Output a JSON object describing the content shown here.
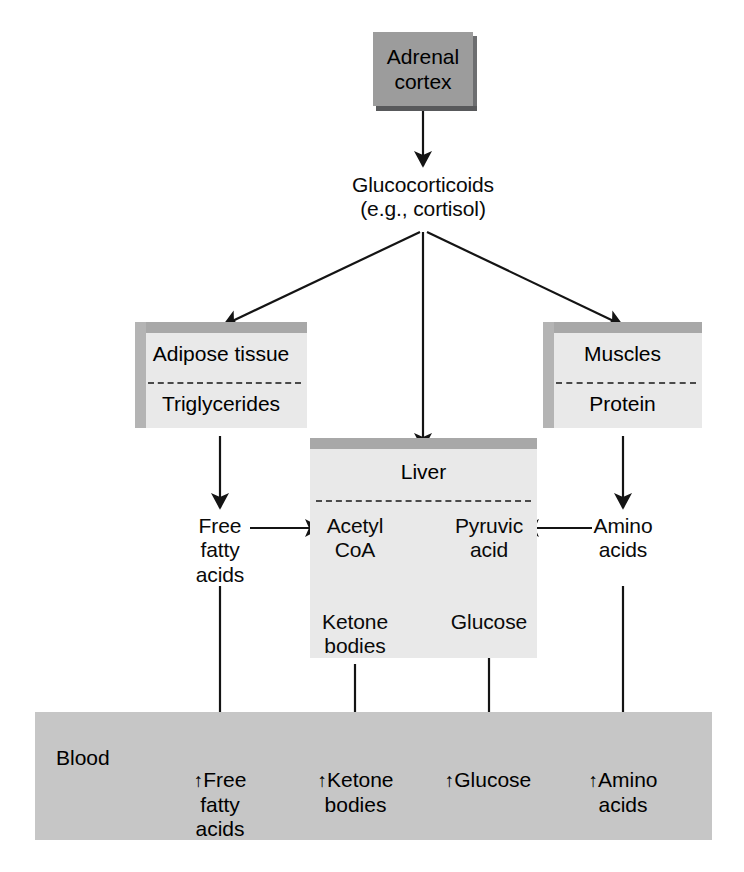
{
  "diagram": {
    "type": "flow-diagram",
    "background_color": "#ffffff",
    "palette": {
      "adrenal_box_fill": "#9c9c9c",
      "adrenal_box_shadow": "#58595b",
      "tissue_box_fill": "#e9e9e9",
      "tissue_box_bevel_top": "#a8a8a8",
      "tissue_box_bevel_side": "#b4b4b4",
      "blood_band_fill": "#c6c6c6",
      "arrow_color": "#141414",
      "text_color": "#0a0a0a"
    }
  },
  "source": {
    "label": "Adrenal\ncortex"
  },
  "hormone": {
    "label": "Glucocorticoids\n(e.g., cortisol)"
  },
  "tissues": {
    "adipose": {
      "title": "Adipose tissue",
      "substrate": "Triglycerides"
    },
    "liver": {
      "title": "Liver",
      "metabolites": {
        "acetyl_coa": "Acetyl\nCoA",
        "pyruvic_acid": "Pyruvic\nacid",
        "ketone_bodies": "Ketone\nbodies",
        "glucose": "Glucose"
      }
    },
    "muscles": {
      "title": "Muscles",
      "substrate": "Protein"
    }
  },
  "intermediates": {
    "free_fatty_acids": "Free\nfatty\nacids",
    "amino_acids": "Amino\nacids"
  },
  "blood": {
    "title": "Blood",
    "entries": [
      {
        "arrow": "↑",
        "label": "Free\nfatty\nacids"
      },
      {
        "arrow": "↑",
        "label": "Ketone\nbodies"
      },
      {
        "arrow": "↑",
        "label": "Glucose"
      },
      {
        "arrow": "↑",
        "label": "Amino\nacids"
      }
    ]
  },
  "edges": [
    {
      "from": "Adrenal cortex",
      "to": "Glucocorticoids",
      "style": "arrow-down"
    },
    {
      "from": "Glucocorticoids",
      "to": "Adipose tissue",
      "style": "arrow-diagonal-left"
    },
    {
      "from": "Glucocorticoids",
      "to": "Liver",
      "style": "arrow-down"
    },
    {
      "from": "Glucocorticoids",
      "to": "Muscles",
      "style": "arrow-diagonal-right"
    },
    {
      "from": "Triglycerides",
      "to": "Free fatty acids",
      "style": "arrow-down"
    },
    {
      "from": "Free fatty acids",
      "to": "Acetyl CoA",
      "style": "arrow-right"
    },
    {
      "from": "Acetyl CoA",
      "to": "Ketone bodies",
      "style": "arrow-down"
    },
    {
      "from": "Pyruvic acid",
      "to": "Glucose",
      "style": "arrow-down"
    },
    {
      "from": "Amino acids",
      "to": "Pyruvic acid",
      "style": "arrow-left"
    },
    {
      "from": "Protein",
      "to": "Amino acids",
      "style": "arrow-down"
    },
    {
      "from": "Free fatty acids",
      "to": "Blood free fatty acids",
      "style": "arrow-down"
    },
    {
      "from": "Ketone bodies",
      "to": "Blood ketone bodies",
      "style": "arrow-down"
    },
    {
      "from": "Glucose",
      "to": "Blood glucose",
      "style": "arrow-down"
    },
    {
      "from": "Amino acids",
      "to": "Blood amino acids",
      "style": "arrow-down"
    }
  ]
}
